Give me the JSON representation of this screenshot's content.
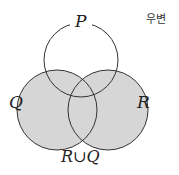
{
  "diagram": {
    "type": "venn",
    "sets": [
      {
        "label": "P",
        "shaded": false
      },
      {
        "label": "Q",
        "shaded": true
      },
      {
        "label": "R",
        "shaded": true
      }
    ],
    "caption": "R∪Q",
    "side_label": "우변",
    "colors": {
      "shade": "#d6d6d6",
      "stroke": "#333333",
      "background": "#ffffff"
    }
  }
}
